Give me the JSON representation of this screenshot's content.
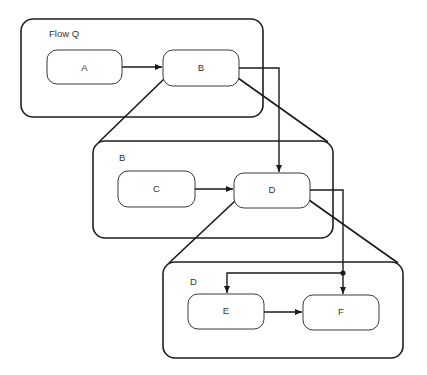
{
  "diagram": {
    "title": "Flow Q",
    "frames": [
      {
        "id": "flow-q",
        "label": "Flow Q",
        "x": 21,
        "y": 19,
        "w": 242,
        "h": 98
      },
      {
        "id": "subflow-b",
        "label": "B",
        "x": 93,
        "y": 141,
        "w": 240,
        "h": 97
      },
      {
        "id": "subflow-d",
        "label": "D",
        "x": 163,
        "y": 262,
        "w": 240,
        "h": 96
      }
    ],
    "nodes": [
      {
        "id": "A",
        "label": "A",
        "x": 47,
        "y": 50,
        "w": 75,
        "h": 34
      },
      {
        "id": "B",
        "label": "B",
        "x": 163,
        "y": 50,
        "w": 76,
        "h": 36
      },
      {
        "id": "C",
        "label": "C",
        "x": 118,
        "y": 171,
        "w": 77,
        "h": 36
      },
      {
        "id": "D",
        "label": "D",
        "x": 234,
        "y": 173,
        "w": 76,
        "h": 35
      },
      {
        "id": "E",
        "label": "E",
        "x": 188,
        "y": 294,
        "w": 76,
        "h": 35
      },
      {
        "id": "F",
        "label": "F",
        "x": 303,
        "y": 295,
        "w": 76,
        "h": 35
      }
    ],
    "edges": [
      {
        "from": "A",
        "to": "B"
      },
      {
        "from": "C",
        "to": "D"
      },
      {
        "from": "E",
        "to": "F"
      },
      {
        "from": "B",
        "to": "D",
        "type": "entry"
      },
      {
        "from": "D",
        "to": "E",
        "type": "entry"
      },
      {
        "from": "D",
        "to": "F",
        "type": "entry"
      }
    ],
    "expansions": [
      {
        "node": "B",
        "expands_to": "subflow-b"
      },
      {
        "node": "D",
        "expands_to": "subflow-d"
      }
    ],
    "colors": {
      "stroke": "#1e1e1e",
      "background": "#ffffff",
      "text": "#333333"
    }
  }
}
